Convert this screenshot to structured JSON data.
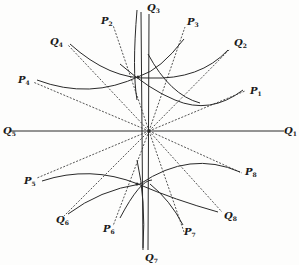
{
  "figure": {
    "center": {
      "x": 149,
      "y": 131
    },
    "ink_color": "#2a2a2a",
    "background": "#fdfdfc",
    "axes": [
      {
        "name": "horizontal-axis",
        "x1": 10,
        "y1": 131,
        "x2": 284,
        "y2": 131
      },
      {
        "name": "vertical-axis-left",
        "x1": 141,
        "y1": 12,
        "x2": 143,
        "y2": 250
      },
      {
        "name": "vertical-axis-right",
        "x1": 149,
        "y1": 14,
        "x2": 148,
        "y2": 250
      }
    ],
    "dashed_rays": [
      {
        "to": "P1",
        "x": 245,
        "y": 91
      },
      {
        "to": "Q2",
        "x": 230,
        "y": 49
      },
      {
        "to": "P3",
        "x": 185,
        "y": 27
      },
      {
        "to": "P2",
        "x": 113,
        "y": 25
      },
      {
        "to": "Q4",
        "x": 68,
        "y": 45
      },
      {
        "to": "P4",
        "x": 33,
        "y": 82
      },
      {
        "to": "P5",
        "x": 37,
        "y": 178
      },
      {
        "to": "Q6",
        "x": 64,
        "y": 216
      },
      {
        "to": "P6",
        "x": 113,
        "y": 226
      },
      {
        "to": "P7",
        "x": 184,
        "y": 232
      },
      {
        "to": "Q8",
        "x": 222,
        "y": 212
      },
      {
        "to": "P8",
        "x": 242,
        "y": 173
      }
    ],
    "curves": [
      {
        "name": "upper-curve-a",
        "d": "M 37 80 Q 90 100 140 76 Q 160 70 184 39"
      },
      {
        "name": "upper-curve-b",
        "d": "M 70 44 Q 110 80 150 78 Q 200 80 228 50"
      },
      {
        "name": "upper-curve-c",
        "d": "M 120 64 Q 150 90 175 100 Q 210 115 243 90"
      },
      {
        "name": "upper-curve-d",
        "d": "M 148 54 Q 170 95 200 103"
      },
      {
        "name": "lower-curve-a",
        "d": "M 42 181 Q 90 165 138 184 Q 175 200 218 212"
      },
      {
        "name": "lower-curve-b",
        "d": "M 68 214 Q 100 190 140 184 Q 190 150 240 172"
      },
      {
        "name": "lower-curve-c",
        "d": "M 120 218 Q 140 180 152 180"
      },
      {
        "name": "lower-curve-d",
        "d": "M 150 184 Q 170 200 183 225"
      },
      {
        "name": "left-arc-top",
        "d": "M 137 100 Q 132 70 137 10"
      },
      {
        "name": "left-arc-bottom",
        "d": "M 137 160 Q 146 200 143 248"
      }
    ],
    "intersection_points": [
      {
        "x": 138,
        "y": 77
      },
      {
        "x": 137,
        "y": 184
      }
    ]
  },
  "labels": {
    "Q3": {
      "letter": "Q",
      "sub": "3",
      "x": 147,
      "y": 3
    },
    "P2": {
      "letter": "P",
      "sub": "2",
      "x": 101,
      "y": 16
    },
    "P3": {
      "letter": "P",
      "sub": "3",
      "x": 187,
      "y": 17
    },
    "Q4": {
      "letter": "Q",
      "sub": "4",
      "x": 50,
      "y": 37
    },
    "Q2": {
      "letter": "Q",
      "sub": "2",
      "x": 234,
      "y": 38
    },
    "P4": {
      "letter": "P",
      "sub": "4",
      "x": 18,
      "y": 75
    },
    "P1": {
      "letter": "P",
      "sub": "1",
      "x": 250,
      "y": 86
    },
    "Q5": {
      "letter": "Q",
      "sub": "5",
      "x": 3,
      "y": 126
    },
    "Q1": {
      "letter": "Q",
      "sub": "1",
      "x": 284,
      "y": 126
    },
    "P5": {
      "letter": "P",
      "sub": "5",
      "x": 24,
      "y": 176
    },
    "P8": {
      "letter": "P",
      "sub": "8",
      "x": 245,
      "y": 167
    },
    "Q6": {
      "letter": "Q",
      "sub": "6",
      "x": 56,
      "y": 215
    },
    "Q8": {
      "letter": "Q",
      "sub": "8",
      "x": 224,
      "y": 211
    },
    "P6": {
      "letter": "P",
      "sub": "6",
      "x": 103,
      "y": 224
    },
    "P7": {
      "letter": "P",
      "sub": "7",
      "x": 184,
      "y": 227
    },
    "Q7": {
      "letter": "Q",
      "sub": "7",
      "x": 145,
      "y": 253
    }
  }
}
